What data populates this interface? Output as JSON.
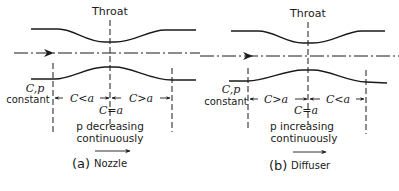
{
  "figure": {
    "panels": [
      {
        "id": "a",
        "caption_marker": "(a)",
        "caption_label": "Nozzle",
        "throat_label": "Throat",
        "inlet_label_line1": "C,p",
        "inlet_label_line2": "constant",
        "left_region": "C<a",
        "throat_condition": "C=a",
        "right_region": "C>a",
        "pressure_line1": "p decreasing",
        "pressure_line2": "continuously"
      },
      {
        "id": "b",
        "caption_marker": "(b)",
        "caption_label": "Diffuser",
        "throat_label": "Throat",
        "inlet_label_line1": "C,p",
        "inlet_label_line2": "constant",
        "left_region": "C>a",
        "throat_condition": "C=a",
        "right_region": "C<a",
        "pressure_line1": "p increasing",
        "pressure_line2": "continuously"
      }
    ]
  }
}
